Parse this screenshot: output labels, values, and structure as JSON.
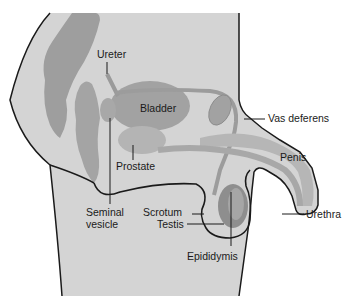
{
  "diagram": {
    "colors": {
      "background": "#ffffff",
      "body": "#d4d4d4",
      "organ_dark": "#9a9a9a",
      "organ_mid": "#a8a8a8",
      "organ_light": "#bcbcbc",
      "outline": "#1a1a1a"
    },
    "labels": {
      "ureter": "Ureter",
      "bladder": "Bladder",
      "vas_deferens": "Vas deferens",
      "penis": "Penis",
      "prostate": "Prostate",
      "seminal_vesicle_line1": "Seminal",
      "seminal_vesicle_line2": "vesicle",
      "scrotum": "Scrotum",
      "testis": "Testis",
      "urethra": "Urethra",
      "epididymis": "Epididymis"
    }
  }
}
